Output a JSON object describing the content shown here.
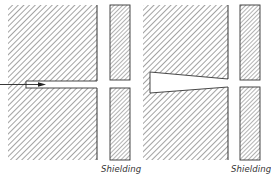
{
  "figure": {
    "panels": [
      {
        "id": "left",
        "description": "Block with straight narrow channel and incident arrow",
        "shielding_label": "Shielding",
        "has_arrow": true
      },
      {
        "id": "right",
        "description": "Block with tapered (wedge-shaped) channel",
        "shielding_label": "Shielding",
        "has_arrow": false
      }
    ],
    "colors": {
      "line": "#333333",
      "hatch": "#555555",
      "background": "#ffffff"
    }
  }
}
